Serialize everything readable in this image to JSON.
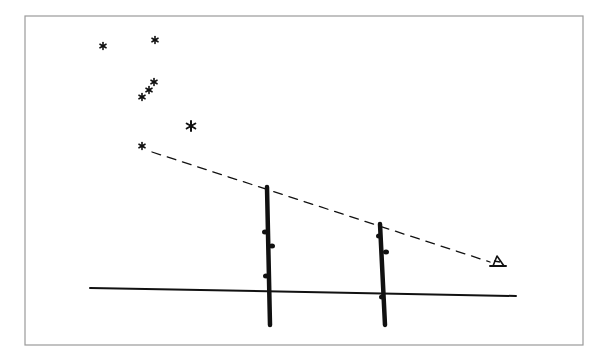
{
  "diagram": {
    "frame": {
      "x": 25,
      "y": 16,
      "width": 558,
      "height": 329,
      "stroke": "#9a9a9a"
    },
    "ink_color": "#111111",
    "stars": [
      {
        "x": 103,
        "y": 46,
        "r": 3.5
      },
      {
        "x": 155,
        "y": 40,
        "r": 3.5
      },
      {
        "x": 154,
        "y": 82,
        "r": 3.5
      },
      {
        "x": 149,
        "y": 90,
        "r": 3.5
      },
      {
        "x": 142,
        "y": 97,
        "r": 3.5
      },
      {
        "x": 191,
        "y": 126,
        "r": 5
      },
      {
        "x": 142,
        "y": 146,
        "r": 3.5
      }
    ],
    "sightline": {
      "x1": 152,
      "y1": 152,
      "x2": 490,
      "y2": 262,
      "dash": "9 7"
    },
    "ground": {
      "x1": 90,
      "y1": 288,
      "x2": 516,
      "y2": 296
    },
    "poles": [
      {
        "name": "near-pole",
        "x_top": 267,
        "y_top": 187,
        "x_bottom": 270,
        "y_bottom": 325,
        "buds": [
          {
            "x": 265,
            "y": 232
          },
          {
            "x": 272,
            "y": 246
          },
          {
            "x": 266,
            "y": 276
          }
        ]
      },
      {
        "name": "far-pole",
        "x_top": 380,
        "y_top": 224,
        "x_bottom": 385,
        "y_bottom": 325,
        "buds": [
          {
            "x": 379,
            "y": 236
          },
          {
            "x": 386,
            "y": 252
          },
          {
            "x": 382,
            "y": 297
          }
        ]
      }
    ],
    "observer_eye": {
      "x": 496,
      "y": 264
    }
  }
}
